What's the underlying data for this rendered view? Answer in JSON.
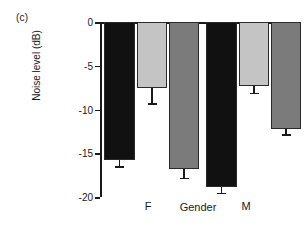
{
  "panel": {
    "label": "(c)"
  },
  "chart_data": {
    "type": "bar",
    "title": "",
    "panel_label": "(c)",
    "xlabel": "Gender",
    "ylabel": "Noise level (dB)",
    "ylim": [
      -20,
      0
    ],
    "yticks": [
      0,
      -5,
      -10,
      -15,
      -20
    ],
    "ytick_labels": [
      "0",
      "-5",
      "-10",
      "-15",
      "-20"
    ],
    "grid": false,
    "legend": "none",
    "categories": [
      "F",
      "M"
    ],
    "category_labels": [
      "F",
      "M"
    ],
    "series": [
      {
        "name": "series-1",
        "color": "#111111",
        "values": [
          -15.8,
          -18.9
        ],
        "errors": [
          0.7,
          0.6
        ]
      },
      {
        "name": "series-2",
        "color": "#c4c4c4",
        "values": [
          -7.5,
          -7.3
        ],
        "errors": [
          1.8,
          0.8
        ]
      },
      {
        "name": "series-3",
        "color": "#7b7b7b",
        "values": [
          -16.8,
          -12.2
        ],
        "errors": [
          1.0,
          0.6
        ]
      }
    ],
    "bars": [
      {
        "id": "bar-1",
        "group": "F",
        "series": "series-1",
        "value": -15.8,
        "error": 0.7,
        "color": "#111111"
      },
      {
        "id": "bar-2",
        "group": "F",
        "series": "series-2",
        "value": -7.5,
        "error": 1.8,
        "color": "#c4c4c4"
      },
      {
        "id": "bar-3",
        "group": "F",
        "series": "series-3",
        "value": -16.8,
        "error": 1.0,
        "color": "#7b7b7b"
      },
      {
        "id": "bar-4",
        "group": "M",
        "series": "series-1",
        "value": -18.9,
        "error": 0.6,
        "color": "#111111"
      },
      {
        "id": "bar-5",
        "group": "M",
        "series": "series-2",
        "value": -7.3,
        "error": 0.8,
        "color": "#c4c4c4"
      },
      {
        "id": "bar-6",
        "group": "M",
        "series": "series-3",
        "value": -12.2,
        "error": 0.6,
        "color": "#7b7b7b"
      }
    ]
  },
  "axis": {
    "y_title": "Noise level (dB)",
    "tick_0": "0",
    "tick_1": "-5",
    "tick_2": "-10",
    "tick_3": "-15",
    "tick_4": "-20",
    "x_label_f": "F",
    "x_label_gender": "Gender",
    "x_label_m": "M"
  }
}
